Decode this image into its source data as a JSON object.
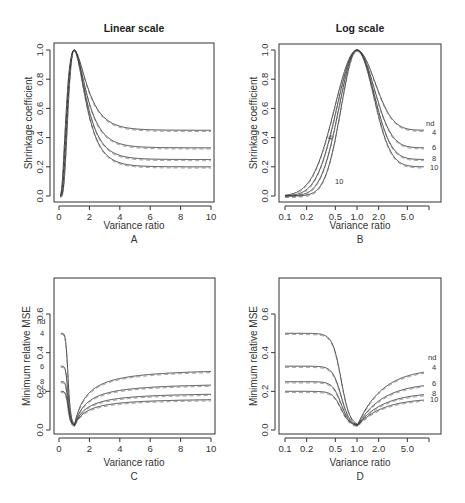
{
  "figure": {
    "col_titles": [
      "Linear scale",
      "Log scale"
    ]
  },
  "chart_data": [
    {
      "panel": "A",
      "type": "line",
      "title": "Linear scale",
      "xlabel": "Variance ratio",
      "ylabel": "Shrinkage coefficient",
      "xscale": "linear",
      "xlim": [
        0,
        10
      ],
      "ylim": [
        0,
        1
      ],
      "xticks": [
        "0",
        "2",
        "4",
        "6",
        "8",
        "10"
      ],
      "yticks": [
        "0.0",
        "0.2",
        "0.4",
        "0.6",
        "0.8",
        "1.0"
      ],
      "series_labels": [],
      "series": [
        {
          "name": "nd=4",
          "peak": [
            1.0,
            1.0
          ],
          "end_value": 0.45
        },
        {
          "name": "nd=6",
          "peak": [
            1.0,
            1.0
          ],
          "end_value": 0.33
        },
        {
          "name": "nd=8",
          "peak": [
            1.0,
            1.0
          ],
          "end_value": 0.25
        },
        {
          "name": "nd=10",
          "peak": [
            1.0,
            1.0
          ],
          "end_value": 0.2
        }
      ],
      "grid": false,
      "legend": "none"
    },
    {
      "panel": "B",
      "type": "line",
      "title": "Log scale",
      "xlabel": "Variance ratio",
      "ylabel": "Shrinkage coefficient",
      "xscale": "log",
      "xlim": [
        0.1,
        10
      ],
      "ylim": [
        0,
        1
      ],
      "xticks": [
        "0.1",
        "0.2",
        "0.5",
        "1.0",
        "2.0",
        "5.0",
        ""
      ],
      "yticks": [
        "0.0",
        "0.2",
        "0.4",
        "0.6",
        "0.8",
        "1.0"
      ],
      "series_labels": [
        "nd",
        "4",
        "6",
        "8",
        "10"
      ],
      "inline_labels": [
        "4",
        "10"
      ],
      "series": [
        {
          "name": "nd=4",
          "end_value": 0.45
        },
        {
          "name": "nd=6",
          "end_value": 0.33
        },
        {
          "name": "nd=8",
          "end_value": 0.25
        },
        {
          "name": "nd=10",
          "end_value": 0.2
        }
      ],
      "grid": false,
      "legend": "right-edge labels"
    },
    {
      "panel": "C",
      "type": "line",
      "title": "",
      "xlabel": "Variance ratio",
      "ylabel": "Minimum relative MSE",
      "xscale": "linear",
      "xlim": [
        0,
        10
      ],
      "ylim": [
        0,
        0.7
      ],
      "xticks": [
        "0",
        "2",
        "4",
        "6",
        "8",
        "10"
      ],
      "yticks": [
        "0.0",
        "0.2",
        "0.4",
        "0.6"
      ],
      "series_labels": [
        "nd",
        "4",
        "6",
        "8",
        "10"
      ],
      "series": [
        {
          "name": "nd=4",
          "start_value": 0.5,
          "min": 0.02,
          "end_value": 0.32
        },
        {
          "name": "nd=6",
          "start_value": 0.33,
          "min": 0.02,
          "end_value": 0.245
        },
        {
          "name": "nd=8",
          "start_value": 0.25,
          "min": 0.02,
          "end_value": 0.195
        },
        {
          "name": "nd=10",
          "start_value": 0.2,
          "min": 0.02,
          "end_value": 0.165
        }
      ],
      "grid": false,
      "legend": "left-edge labels"
    },
    {
      "panel": "D",
      "type": "line",
      "title": "",
      "xlabel": "Variance ratio",
      "ylabel": "Minimum relative MSE",
      "xscale": "log",
      "xlim": [
        0.1,
        10
      ],
      "ylim": [
        0,
        0.7
      ],
      "xticks": [
        "0.1",
        "0.2",
        "0.5",
        "1.0",
        "2.0",
        "5.0",
        ""
      ],
      "yticks": [
        "0.0",
        "0.2",
        "0.4",
        "0.6"
      ],
      "series_labels": [
        "nd",
        "4",
        "6",
        "8",
        "10"
      ],
      "series": [
        {
          "name": "nd=4",
          "start_value": 0.5,
          "min": 0.02,
          "end_value": 0.32
        },
        {
          "name": "nd=6",
          "start_value": 0.33,
          "min": 0.02,
          "end_value": 0.245
        },
        {
          "name": "nd=8",
          "start_value": 0.25,
          "min": 0.02,
          "end_value": 0.195
        },
        {
          "name": "nd=10",
          "start_value": 0.2,
          "min": 0.02,
          "end_value": 0.165
        }
      ],
      "grid": false,
      "legend": "right-edge labels"
    }
  ],
  "panels": {
    "A": {
      "letter": "A",
      "title": "Linear scale",
      "xlabel": "Variance ratio",
      "ylabel": "Shrinkage coefficient"
    },
    "B": {
      "letter": "B",
      "title": "Log scale",
      "xlabel": "Variance ratio",
      "ylabel": "Shrinkage coefficient",
      "labels": {
        "nd": "nd",
        "l4": "4",
        "l6": "6",
        "l8": "8",
        "l10": "10",
        "in4": "4",
        "in10": "10"
      }
    },
    "C": {
      "letter": "C",
      "xlabel": "Variance ratio",
      "ylabel": "Minimum relative MSE",
      "labels": {
        "nd": "nd",
        "l4": "4",
        "l6": "6",
        "l8": "8",
        "l10": "10"
      }
    },
    "D": {
      "letter": "D",
      "xlabel": "Variance ratio",
      "ylabel": "Minimum relative MSE",
      "labels": {
        "nd": "nd",
        "l4": "4",
        "l6": "6",
        "l8": "8",
        "l10": "10"
      }
    }
  },
  "ticks": {
    "lin_x": [
      "0",
      "2",
      "4",
      "6",
      "8",
      "10"
    ],
    "log_x": [
      "0.1",
      "0.2",
      "0.5",
      "1.0",
      "2.0",
      "5.0"
    ],
    "shrink_y": [
      "0.0",
      "0.2",
      "0.4",
      "0.6",
      "0.8",
      "1.0"
    ],
    "mse_y": [
      "0.0",
      "0.2",
      "0.4",
      "0.6"
    ]
  }
}
